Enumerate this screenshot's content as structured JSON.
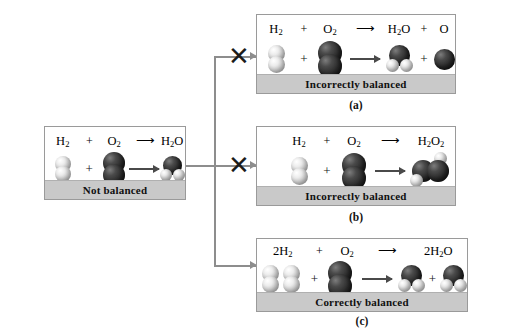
{
  "figure": {
    "background_color": "#ffffff",
    "panel_border_color": "#9a9a9a",
    "footer_fill_color": "#c9c9c9",
    "oxygen_color": "#2a2a2a",
    "hydrogen_color": "#e8e8e8",
    "connector_color": "#8d8d8d"
  },
  "panels": [
    {
      "id": "not-balanced",
      "status_label": "Not balanced",
      "sub_label": "",
      "equation": {
        "reactant_1": "H2",
        "plus_1": "+",
        "reactant_2": "O2",
        "arrow": "⟶",
        "product_1": "H2O",
        "plus_2": "",
        "product_2": ""
      },
      "formula_parts": [
        {
          "text": "H",
          "sub": "2"
        },
        {
          "text": "+",
          "sub": ""
        },
        {
          "text": "O",
          "sub": "2"
        },
        {
          "text": "⟶",
          "sub": ""
        },
        {
          "text": "H",
          "sub": "2",
          "tail": "O"
        }
      ]
    },
    {
      "id": "incorrect-a",
      "status_label": "Incorrectly balanced",
      "sub_label": "(a)",
      "equation": {
        "reactant_1": "H2",
        "plus_1": "+",
        "reactant_2": "O2",
        "arrow": "⟶",
        "product_1": "H2O",
        "plus_2": "+",
        "product_2": "O"
      }
    },
    {
      "id": "incorrect-b",
      "status_label": "Incorrectly balanced",
      "sub_label": "(b)",
      "equation": {
        "reactant_1": "H2",
        "plus_1": "+",
        "reactant_2": "O2",
        "arrow": "⟶",
        "product_1": "H2O2",
        "plus_2": "",
        "product_2": ""
      }
    },
    {
      "id": "correct-c",
      "status_label": "Correctly balanced",
      "sub_label": "(c)",
      "equation": {
        "reactant_1": "2H2",
        "plus_1": "+",
        "reactant_2": "O2",
        "arrow": "⟶",
        "product_1": "2H2O",
        "plus_2": "+",
        "product_2": "H2O"
      }
    }
  ],
  "labels": {
    "H": "H",
    "O": "O",
    "sub_2": "2",
    "coeff_2": "2",
    "plus": "+",
    "arrow": "⟶",
    "x_mark": "✕",
    "not_balanced": "Not balanced",
    "incorrectly_balanced": "Incorrectly balanced",
    "correctly_balanced": "Correctly balanced",
    "label_a": "(a)",
    "label_b": "(b)",
    "label_c": "(c)"
  }
}
